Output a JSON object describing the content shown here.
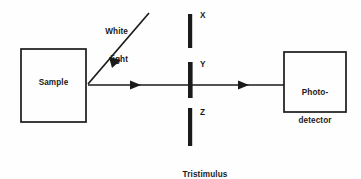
{
  "diagram": {
    "background_color": "#fefefe",
    "stroke_color": "#1a1a1a",
    "blocks": [
      {
        "id": "sample",
        "label": "Sample",
        "x": 21,
        "y": 49,
        "width": 65,
        "height": 73
      },
      {
        "id": "photodetector",
        "label": "Photo-\ndetector",
        "x": 284,
        "y": 52,
        "width": 62,
        "height": 60
      }
    ],
    "source": {
      "label": "White\nlight",
      "arrow_from": [
        149,
        13
      ],
      "arrow_to": [
        88,
        84
      ]
    },
    "filters": {
      "caption": "Tristimulus\nfilter",
      "bars": [
        {
          "id": "x",
          "label": "X",
          "x": 188,
          "y_top": 14,
          "y_bottom": 48
        },
        {
          "id": "y",
          "label": "Y",
          "x": 188,
          "y_top": 62,
          "y_bottom": 98
        },
        {
          "id": "z",
          "label": "Z",
          "x": 188,
          "y_top": 108,
          "y_bottom": 146
        }
      ]
    },
    "beam": {
      "y": 85,
      "segments": [
        {
          "id": "sample-to-filter",
          "from_x": 88,
          "to_x": 188,
          "arrow_x": 137
        },
        {
          "id": "filter-to-detector",
          "from_x": 193,
          "to_x": 284,
          "arrow_x": 245
        }
      ]
    }
  },
  "labels": {
    "sample": "Sample",
    "detector_line1": "Photo-",
    "detector_line2": "detector",
    "white_light_line1": "White",
    "white_light_line2": "light",
    "filter_x": "X",
    "filter_y": "Y",
    "filter_z": "Z",
    "caption_line1": "Tristimulus",
    "caption_line2": "filter"
  },
  "colors": {
    "stroke": "#1a1a1a",
    "text": "#1a1a1a",
    "background": "#fefefe"
  }
}
